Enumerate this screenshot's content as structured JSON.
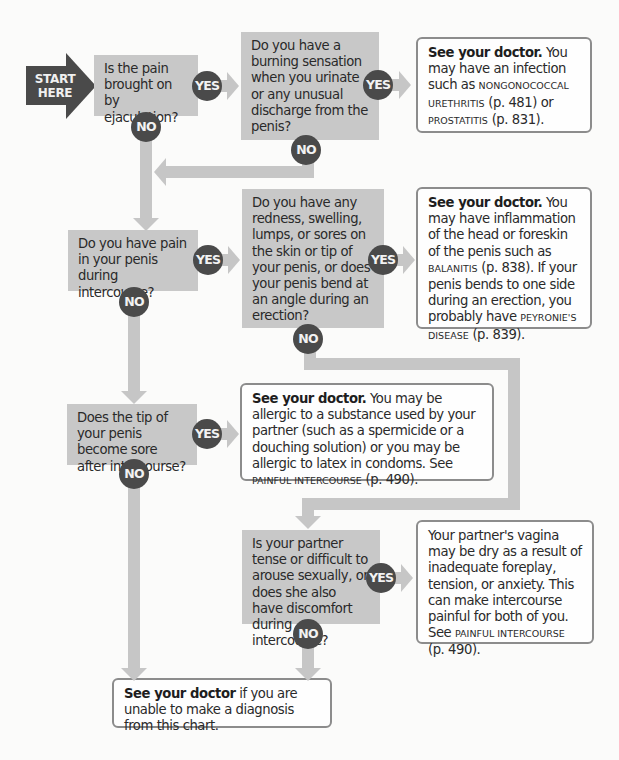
{
  "start": {
    "line1": "START",
    "line2": "HERE"
  },
  "labels": {
    "yes": "YES",
    "no": "NO"
  },
  "questions": [
    {
      "id": "q1",
      "text": "Is the pain brought on by ejaculation?"
    },
    {
      "id": "q2",
      "text": "Do you have a burning sensation when you urinate or any unusual discharge from the penis?"
    },
    {
      "id": "q3",
      "text": "Do you have pain in your penis during intercourse?"
    },
    {
      "id": "q4",
      "text": "Do you have any redness, swelling, lumps, or sores on the skin or tip of your penis, or does your penis bend at an angle during an erection?"
    },
    {
      "id": "q5",
      "text": "Does the tip of your penis become sore after intercourse?"
    },
    {
      "id": "q6",
      "text": "Is your partner tense or difficult to arouse sexually, or does she also have discomfort during intercourse?"
    }
  ],
  "answers": {
    "a1": {
      "bold": "See your doctor.",
      "t1": " You may have an infection such as ",
      "sc1": "Nongonococcal urethritis",
      "t2": " (p. 481) or ",
      "sc2": "prostatitis",
      "t3": " (p. 831)."
    },
    "a2": {
      "bold": "See your doctor.",
      "t1": " You may have inflammation of the head or foreskin of the penis such as ",
      "sc1": "balanitis",
      "t2": " (p. 838). If your penis bends to one side during an erection, you probably have ",
      "sc2": "Peyronie's disease",
      "t3": " (p. 839)."
    },
    "a3": {
      "bold": "See your doctor.",
      "t1": " You may be allergic to a substance used by your partner (such as a spermicide or a douching solution) or you may be allergic to latex in condoms. See ",
      "sc1": "painful intercourse",
      "t2": " (p. 490)."
    },
    "a4": {
      "t1": "Your partner's vagina may be dry as a result of inadequate foreplay, tension, or anxiety. This can make intercourse painful for both of you. See ",
      "sc1": "painful intercourse",
      "t2": " (p. 490)."
    },
    "final": {
      "bold": "See your doctor",
      "t1": " if you are unable to make a diagnosis from this chart."
    }
  },
  "colors": {
    "question_box": "#c8c8c8",
    "badge": "#4a4a4a",
    "connector": "#c6c6c6",
    "answer_border": "#8c8c8c"
  }
}
